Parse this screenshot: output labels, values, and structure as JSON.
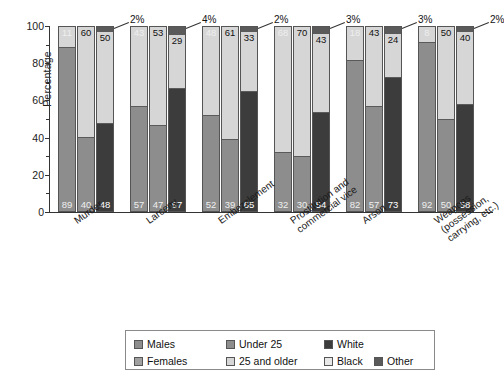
{
  "chart_data": {
    "type": "bar",
    "subtype": "grouped-stacked-100-percent",
    "title": "",
    "xlabel": "",
    "ylabel": "Percentage",
    "ylim": [
      0,
      100
    ],
    "yticks": [
      0,
      20,
      40,
      60,
      80,
      100
    ],
    "yticks_minor": [
      10,
      30,
      50,
      70,
      90
    ],
    "grid": false,
    "legend_position": "bottom",
    "categories": [
      "Murder",
      "Larceny",
      "Embezzlement",
      "Prostitution and commercial vice",
      "Arson",
      "Weapons (possession, carrying, etc.)"
    ],
    "bars_per_group": [
      {
        "name": "Sex",
        "series": [
          "Males",
          "Females"
        ]
      },
      {
        "name": "Age",
        "series": [
          "Under 25",
          "25 and older"
        ]
      },
      {
        "name": "Race",
        "series": [
          "White",
          "Black",
          "Other"
        ]
      }
    ],
    "series": [
      {
        "name": "Males",
        "bar": 0,
        "values": [
          89,
          57,
          52,
          32,
          82,
          92
        ]
      },
      {
        "name": "Females",
        "bar": 0,
        "values": [
          11,
          43,
          48,
          68,
          18,
          8
        ]
      },
      {
        "name": "Under 25",
        "bar": 1,
        "values": [
          40,
          47,
          39,
          30,
          57,
          50
        ]
      },
      {
        "name": "25 and older",
        "bar": 1,
        "values": [
          60,
          53,
          61,
          70,
          43,
          50
        ]
      },
      {
        "name": "White",
        "bar": 2,
        "values": [
          48,
          67,
          65,
          54,
          73,
          58
        ]
      },
      {
        "name": "Black",
        "bar": 2,
        "values": [
          50,
          29,
          33,
          43,
          24,
          40
        ]
      },
      {
        "name": "Other",
        "bar": 2,
        "values": [
          2,
          4,
          2,
          3,
          3,
          2
        ]
      }
    ],
    "other_callouts": [
      "2%",
      "4%",
      "2%",
      "3%",
      "3%",
      "2%"
    ],
    "colors": {
      "males": "#8d8d8d",
      "females": "#a0a0a0",
      "under25": "#8d8d8d",
      "older25": "#d6d6d6",
      "white": "#3c3c3c",
      "black": "#e8e8e8",
      "other": "#5a5a5a"
    }
  },
  "legend": {
    "items": [
      {
        "label": "Males",
        "swatch": "#8d8d8d"
      },
      {
        "label": "Females",
        "swatch": "#a0a0a0"
      },
      {
        "label": "Under 25",
        "swatch": "#8d8d8d"
      },
      {
        "label": "25 and older",
        "swatch": "#d6d6d6"
      },
      {
        "label": "White",
        "swatch": "#3c3c3c"
      },
      {
        "label": "Black",
        "swatch": "#e8e8e8"
      },
      {
        "label": "Other",
        "swatch": "#5a5a5a"
      }
    ]
  }
}
